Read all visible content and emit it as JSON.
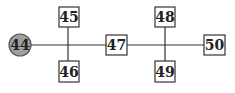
{
  "diagram": {
    "nodes": [
      {
        "id": "44",
        "label": "44",
        "shape": "circle",
        "fill": "#a0a0a0"
      },
      {
        "id": "45",
        "label": "45",
        "shape": "box"
      },
      {
        "id": "46",
        "label": "46",
        "shape": "box"
      },
      {
        "id": "47",
        "label": "47",
        "shape": "box"
      },
      {
        "id": "48",
        "label": "48",
        "shape": "box"
      },
      {
        "id": "49",
        "label": "49",
        "shape": "box"
      },
      {
        "id": "50",
        "label": "50",
        "shape": "box"
      }
    ],
    "edges": [
      {
        "from": "44",
        "to": "47"
      },
      {
        "from": "45",
        "to": "46"
      },
      {
        "from": "47",
        "to": "50"
      },
      {
        "from": "48",
        "to": "49"
      }
    ],
    "colors": {
      "line": "#333333",
      "highlight": "#a0a0a0"
    }
  }
}
